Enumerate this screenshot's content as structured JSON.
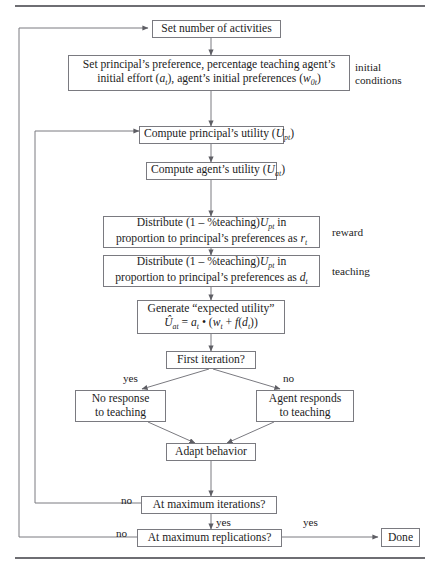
{
  "figure": {
    "type": "flowchart",
    "title_rule_top": "horizontal-rule",
    "title_rule_bottom": "horizontal-rule"
  },
  "nodes": {
    "set_activities": "Set number of activities",
    "initial_setup_line1": "Set principal’s preference, percentage teaching agent’s",
    "initial_setup_line2_pre": "initial effort (",
    "initial_setup_line2_var1": "a",
    "initial_setup_line2_var1_sub": "t",
    "initial_setup_line2_mid": "), agent’s initial preferences (",
    "initial_setup_line2_var2": "w",
    "initial_setup_line2_var2_sub": "0t",
    "initial_setup_line2_post": ")",
    "compute_principal_utility_pre": "Compute principal’s utility (",
    "compute_principal_utility_var": "U",
    "compute_principal_utility_sub": "pt",
    "compute_principal_utility_post": ")",
    "compute_agent_utility_pre": "Compute agent’s utility (",
    "compute_agent_utility_var": "U",
    "compute_agent_utility_sub": "at",
    "compute_agent_utility_post": ")",
    "distribute_reward_line1_pre": "Distribute (1 – %teaching)",
    "distribute_reward_line1_var": "U",
    "distribute_reward_line1_sub": "pt",
    "distribute_reward_line1_post": " in",
    "distribute_reward_line2_pre": "proportion to principal’s preferences as ",
    "distribute_reward_line2_var": "r",
    "distribute_reward_line2_sub": "t",
    "distribute_teaching_line1_pre": "Distribute (1 – %teaching)",
    "distribute_teaching_line1_var": "U",
    "distribute_teaching_line1_sub": "pt",
    "distribute_teaching_line1_post": " in",
    "distribute_teaching_line2_pre": "proportion to principal’s preferences as ",
    "distribute_teaching_line2_var": "d",
    "distribute_teaching_line2_sub": "t",
    "expected_utility_line1": "Generate “expected utility”",
    "expected_utility_formula": {
      "lhs_hat": "Û",
      "lhs_sub": "at",
      "eq": " = ",
      "a": "a",
      "a_sub": "t",
      "dot": " • (",
      "w": "w",
      "w_sub": "t",
      "plus": " + ",
      "f": "f",
      "fopen": "(",
      "d": "d",
      "d_sub": "t",
      "close": "))"
    },
    "first_iteration": "First iteration?",
    "no_response_line1": "No response",
    "no_response_line2": "to teaching",
    "agent_responds_line1": "Agent responds",
    "agent_responds_line2": "to teaching",
    "adapt_behavior": "Adapt behavior",
    "max_iterations": "At maximum iterations?",
    "max_replications": "At maximum replications?",
    "done": "Done"
  },
  "side_labels": {
    "initial_conditions_line1": "initial",
    "initial_conditions_line2": "conditions",
    "reward": "reward",
    "teaching": "teaching"
  },
  "edge_labels": {
    "first_iteration_yes": "yes",
    "first_iteration_no": "no",
    "max_iterations_no": "no",
    "max_iterations_yes": "yes",
    "max_replications_no": "no",
    "max_replications_yes": "yes"
  },
  "colors": {
    "line": "#7a7a80",
    "rule": "#6e6e73",
    "text": "#1c1c1c",
    "background": "#ffffff"
  }
}
